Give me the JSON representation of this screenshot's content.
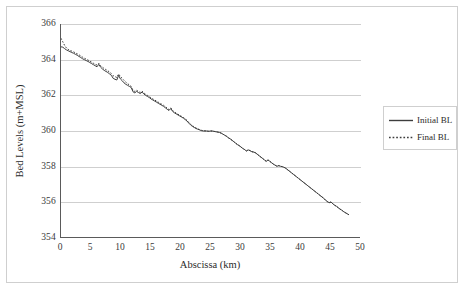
{
  "chart_data": {
    "type": "line",
    "title": "",
    "xlabel": "Abscissa (km)",
    "ylabel": "Bed Levels (m+MSL)",
    "xlim": [
      0,
      50
    ],
    "ylim": [
      354,
      366
    ],
    "xticks": [
      0,
      5,
      10,
      15,
      20,
      25,
      30,
      35,
      40,
      45,
      50
    ],
    "yticks": [
      354,
      356,
      358,
      360,
      362,
      364,
      366
    ],
    "grid": "horizontal",
    "legend_position": "right",
    "line_color": "#3d3d3d",
    "grid_color": "#cfcfcf",
    "axis_color": "#5a5a5a",
    "series": [
      {
        "name": "Initial BL",
        "style": "solid",
        "x": [
          0.0,
          0.3,
          0.6,
          0.9,
          1.2,
          1.5,
          1.8,
          2.1,
          2.4,
          2.7,
          3.0,
          3.3,
          3.6,
          3.9,
          4.2,
          4.5,
          4.8,
          5.1,
          5.4,
          5.7,
          6.0,
          6.3,
          6.6,
          6.9,
          7.2,
          7.5,
          7.8,
          8.1,
          8.4,
          8.7,
          9.0,
          9.3,
          9.6,
          9.9,
          10.2,
          10.5,
          10.8,
          11.1,
          11.4,
          11.7,
          12.0,
          12.3,
          12.6,
          12.9,
          13.2,
          13.5,
          13.8,
          14.1,
          14.4,
          14.7,
          15.0,
          15.3,
          15.6,
          15.9,
          16.2,
          16.5,
          16.8,
          17.1,
          17.4,
          17.7,
          18.0,
          18.3,
          18.6,
          18.9,
          19.2,
          19.5,
          19.8,
          20.1,
          20.4,
          20.7,
          21.0,
          21.3,
          21.6,
          21.9,
          22.2,
          22.5,
          22.8,
          23.1,
          23.4,
          23.7,
          24.0,
          24.3,
          24.6,
          24.9,
          25.2,
          25.5,
          25.8,
          26.1,
          26.4,
          26.7,
          27.0,
          27.3,
          27.6,
          27.9,
          28.2,
          28.5,
          28.8,
          29.1,
          29.4,
          29.7,
          30.0,
          30.3,
          30.6,
          30.9,
          31.2,
          31.5,
          31.8,
          32.1,
          32.4,
          32.7,
          33.0,
          33.3,
          33.6,
          33.9,
          34.2,
          34.5,
          34.8,
          35.1,
          35.4,
          35.7,
          36.0,
          36.3,
          36.6,
          36.9,
          37.2,
          37.5,
          37.8,
          38.1,
          38.4,
          38.7,
          39.0,
          39.3,
          39.6,
          39.9,
          40.2,
          40.5,
          40.8,
          41.1,
          41.4,
          41.7,
          42.0,
          42.3,
          42.6,
          42.9,
          43.2,
          43.5,
          43.8,
          44.1,
          44.4,
          44.7,
          45.0,
          45.3,
          45.6,
          45.9,
          46.2,
          46.5,
          46.8,
          47.1,
          47.4,
          47.7,
          48.0
        ],
        "y": [
          364.72,
          364.7,
          364.62,
          364.55,
          364.5,
          364.45,
          364.4,
          364.36,
          364.3,
          364.25,
          364.18,
          364.12,
          364.05,
          364.0,
          363.95,
          363.9,
          363.84,
          363.78,
          363.72,
          363.66,
          363.6,
          363.74,
          363.58,
          363.48,
          363.4,
          363.34,
          363.28,
          363.2,
          363.12,
          362.95,
          362.9,
          362.86,
          363.12,
          362.92,
          362.82,
          362.7,
          362.62,
          362.56,
          362.5,
          362.44,
          362.2,
          362.14,
          362.22,
          362.16,
          362.1,
          362.18,
          362.08,
          362.0,
          361.94,
          361.88,
          361.8,
          361.74,
          361.68,
          361.62,
          361.56,
          361.5,
          361.44,
          361.38,
          361.3,
          361.22,
          361.15,
          361.26,
          361.1,
          361.02,
          360.96,
          360.9,
          360.84,
          360.78,
          360.72,
          360.64,
          360.56,
          360.44,
          360.34,
          360.26,
          360.2,
          360.14,
          360.1,
          360.06,
          360.02,
          360.0,
          360.0,
          360.0,
          359.98,
          360.0,
          360.0,
          359.98,
          359.96,
          359.94,
          359.92,
          359.88,
          359.82,
          359.76,
          359.7,
          359.62,
          359.56,
          359.48,
          359.4,
          359.32,
          359.24,
          359.18,
          359.1,
          359.02,
          358.96,
          358.88,
          358.94,
          358.9,
          358.84,
          358.82,
          358.78,
          358.7,
          358.62,
          358.54,
          358.46,
          358.38,
          358.3,
          358.38,
          358.3,
          358.22,
          358.14,
          358.08,
          358.02,
          358.06,
          358.02,
          358.0,
          357.96,
          357.9,
          357.82,
          357.74,
          357.66,
          357.58,
          357.5,
          357.42,
          357.34,
          357.26,
          357.18,
          357.1,
          357.02,
          356.94,
          356.86,
          356.78,
          356.7,
          356.62,
          356.54,
          356.46,
          356.38,
          356.3,
          356.22,
          356.12,
          356.04,
          355.98,
          356.02,
          355.92,
          355.84,
          355.78,
          355.7,
          355.62,
          355.56,
          355.48,
          355.42,
          355.36,
          355.3
        ]
      },
      {
        "name": "Final BL",
        "style": "dotted",
        "x": [
          0.0,
          0.3,
          0.6,
          0.9,
          1.2,
          1.5,
          1.8,
          2.1,
          2.4,
          2.7,
          3.0,
          3.3,
          3.6,
          3.9,
          4.2,
          4.5,
          4.8,
          5.1,
          5.4,
          5.7,
          6.0,
          6.3,
          6.6,
          6.9,
          7.2,
          7.5,
          7.8,
          8.1,
          8.4,
          8.7,
          9.0,
          9.3,
          9.6,
          9.9,
          10.2,
          10.5,
          10.8,
          11.1,
          11.4,
          11.7,
          12.0,
          12.3,
          12.6,
          12.9,
          13.2,
          13.5,
          13.8,
          14.1,
          14.4,
          14.7,
          15.0,
          15.3,
          15.6,
          15.9,
          16.2,
          16.5,
          16.8,
          17.1,
          17.4,
          17.7,
          18.0,
          18.3,
          18.6,
          18.9,
          19.2,
          19.5,
          19.8,
          20.1,
          20.4,
          20.7,
          21.0,
          21.3,
          21.6,
          21.9,
          22.2,
          22.5,
          22.8,
          23.1,
          23.4,
          23.7,
          24.0,
          24.3,
          24.6,
          24.9,
          25.2,
          25.5,
          25.8,
          26.1,
          26.4,
          26.7,
          27.0,
          27.3,
          27.6,
          27.9,
          28.2,
          28.5,
          28.8,
          29.1,
          29.4,
          29.7,
          30.0,
          30.3,
          30.6,
          30.9,
          31.2,
          31.5,
          31.8,
          32.1,
          32.4,
          32.7,
          33.0,
          33.3,
          33.6,
          33.9,
          34.2,
          34.5,
          34.8,
          35.1,
          35.4,
          35.7,
          36.0,
          36.3,
          36.6,
          36.9,
          37.2,
          37.5,
          37.8,
          38.1,
          38.4,
          38.7,
          39.0,
          39.3,
          39.6,
          39.9,
          40.2,
          40.5,
          40.8,
          41.1,
          41.4,
          41.7,
          42.0,
          42.3,
          42.6,
          42.9,
          43.2,
          43.5,
          43.8,
          44.1,
          44.4,
          44.7,
          45.0,
          45.3,
          45.6,
          45.9,
          46.2,
          46.5,
          46.8,
          47.1,
          47.4,
          47.7,
          48.0
        ],
        "y": [
          365.2,
          365.0,
          364.8,
          364.66,
          364.58,
          364.52,
          364.48,
          364.44,
          364.38,
          364.33,
          364.27,
          364.21,
          364.14,
          364.08,
          364.03,
          363.98,
          363.92,
          363.86,
          363.8,
          363.74,
          363.7,
          363.8,
          363.66,
          363.58,
          363.5,
          363.44,
          363.38,
          363.3,
          363.22,
          363.1,
          363.05,
          363.0,
          363.2,
          363.05,
          362.95,
          362.84,
          362.74,
          362.66,
          362.58,
          362.5,
          362.28,
          362.22,
          362.28,
          362.22,
          362.16,
          362.24,
          362.14,
          362.06,
          362.0,
          361.94,
          361.86,
          361.8,
          361.74,
          361.68,
          361.62,
          361.56,
          361.5,
          361.44,
          361.36,
          361.28,
          361.2,
          361.3,
          361.15,
          361.07,
          361.0,
          360.94,
          360.88,
          360.82,
          360.76,
          360.68,
          360.6,
          360.48,
          360.38,
          360.3,
          360.23,
          360.17,
          360.12,
          360.08,
          360.04,
          360.02,
          360.01,
          360.0,
          359.99,
          360.0,
          360.0,
          359.98,
          359.96,
          359.94,
          359.92,
          359.88,
          359.82,
          359.76,
          359.7,
          359.62,
          359.56,
          359.48,
          359.4,
          359.32,
          359.24,
          359.18,
          359.1,
          359.02,
          358.96,
          358.88,
          358.94,
          358.9,
          358.84,
          358.82,
          358.78,
          358.7,
          358.62,
          358.54,
          358.46,
          358.38,
          358.3,
          358.38,
          358.3,
          358.22,
          358.14,
          358.08,
          358.02,
          358.06,
          358.02,
          358.0,
          357.96,
          357.9,
          357.82,
          357.74,
          357.66,
          357.58,
          357.5,
          357.42,
          357.34,
          357.26,
          357.18,
          357.1,
          357.02,
          356.94,
          356.86,
          356.78,
          356.7,
          356.62,
          356.54,
          356.46,
          356.38,
          356.3,
          356.22,
          356.12,
          356.04,
          355.98,
          356.02,
          355.92,
          355.84,
          355.78,
          355.7,
          355.62,
          355.56,
          355.48,
          355.42,
          355.36,
          355.3
        ]
      }
    ]
  },
  "legend": {
    "items": [
      {
        "label": "Initial BL",
        "style": "solid"
      },
      {
        "label": "Final BL",
        "style": "dotted"
      }
    ]
  }
}
